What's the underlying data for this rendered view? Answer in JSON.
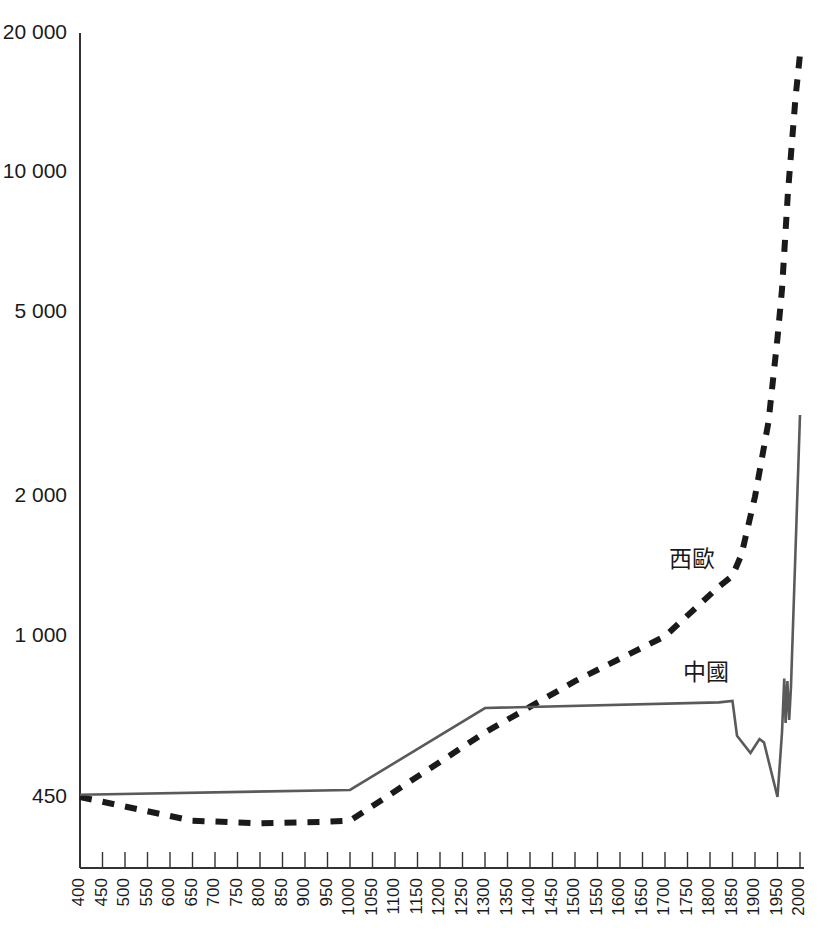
{
  "chart_data": {
    "type": "line",
    "title": "",
    "subtitle": "",
    "xlabel": "",
    "ylabel": "",
    "yscale": "log",
    "ylim": [
      400,
      20000
    ],
    "xlim": [
      400,
      2000
    ],
    "grid": false,
    "legend_position": "inline-annotation",
    "y_ticks": [
      450,
      1000,
      2000,
      5000,
      10000,
      20000
    ],
    "y_tick_labels": [
      "450",
      "1 000",
      "2 000",
      "5 000",
      "10 000",
      "20 000"
    ],
    "x_ticks": [
      400,
      450,
      500,
      550,
      600,
      650,
      700,
      750,
      800,
      850,
      900,
      950,
      1000,
      1050,
      1100,
      1150,
      1200,
      1250,
      1300,
      1350,
      1400,
      1450,
      1500,
      1550,
      1600,
      1650,
      1700,
      1750,
      1800,
      1850,
      1900,
      1950,
      2000
    ],
    "x_tick_labels": [
      "400",
      "450",
      "500",
      "550",
      "600",
      "650",
      "700",
      "750",
      "800",
      "850",
      "900",
      "950",
      "1000",
      "1050",
      "1100",
      "1150",
      "1200",
      "1250",
      "1300",
      "1350",
      "1400",
      "1450",
      "1500",
      "1550",
      "1600",
      "1650",
      "1700",
      "1750",
      "1800",
      "1850",
      "1900",
      "1950",
      "2000"
    ],
    "series": [
      {
        "name": "西歐",
        "label": "西歐",
        "style": "dashed",
        "color": "#1a1a1a",
        "label_x": 1760,
        "label_y": 1450,
        "points": [
          [
            400,
            450
          ],
          [
            650,
            400
          ],
          [
            800,
            395
          ],
          [
            950,
            398
          ],
          [
            1000,
            400
          ],
          [
            1300,
            620
          ],
          [
            1500,
            800
          ],
          [
            1700,
            1000
          ],
          [
            1820,
            1280
          ],
          [
            1850,
            1350
          ],
          [
            1870,
            1500
          ],
          [
            1900,
            2000
          ],
          [
            1930,
            2900
          ],
          [
            1950,
            4400
          ],
          [
            1960,
            5600
          ],
          [
            1973,
            9000
          ],
          [
            1990,
            14500
          ],
          [
            2000,
            18000
          ]
        ]
      },
      {
        "name": "中國",
        "label": "中國",
        "style": "solid",
        "color": "#5a5a5a",
        "label_x": 1790,
        "label_y": 830,
        "points": [
          [
            400,
            455
          ],
          [
            1000,
            466
          ],
          [
            1300,
            700
          ],
          [
            1820,
            720
          ],
          [
            1850,
            725
          ],
          [
            1860,
            610
          ],
          [
            1890,
            560
          ],
          [
            1910,
            600
          ],
          [
            1920,
            590
          ],
          [
            1950,
            450
          ],
          [
            1960,
            620
          ],
          [
            1965,
            810
          ],
          [
            1968,
            650
          ],
          [
            1972,
            800
          ],
          [
            1976,
            660
          ],
          [
            1980,
            780
          ],
          [
            2000,
            3000
          ]
        ]
      }
    ]
  }
}
